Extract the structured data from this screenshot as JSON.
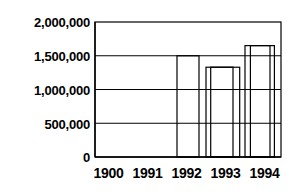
{
  "chart_data": {
    "type": "bar",
    "title": "",
    "xlabel": "",
    "ylabel": "",
    "categories": [
      "1900",
      "1991",
      "1992",
      "1993",
      "1994"
    ],
    "values": [
      700000,
      1000000,
      1500000,
      1330000,
      1650000
    ],
    "ylim": [
      0,
      2000000
    ],
    "yticks": [
      0,
      500000,
      1000000,
      1500000,
      2000000
    ],
    "ytick_labels": [
      "0",
      "500,000",
      "1,000,000",
      "1,500,000",
      "2,000,000"
    ],
    "grid": true,
    "grid_axis": "y",
    "legend": "none",
    "bar_fill": "#ffffff",
    "bar_edge": "#000000",
    "axis_color": "#000000",
    "background": "#ffffff"
  },
  "axes": {
    "y_tick_0": "0",
    "y_tick_1": "500,000",
    "y_tick_2": "1,000,000",
    "y_tick_3": "1,500,000",
    "y_tick_4": "2,000,000",
    "x_tick_0": "1900",
    "x_tick_1": "1991",
    "x_tick_2": "1992",
    "x_tick_3": "1993",
    "x_tick_4": "1994"
  }
}
